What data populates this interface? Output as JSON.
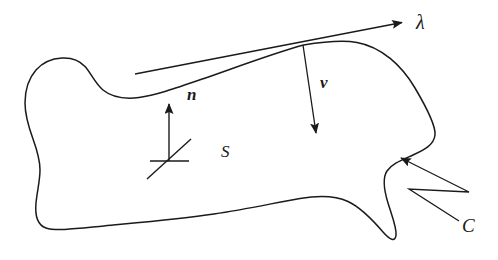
{
  "figure": {
    "background_color": "#ffffff",
    "stroke_color": "#1a1a1a",
    "width": 498,
    "height": 260
  },
  "labels": {
    "lambda": {
      "text": "λ",
      "name": "tangent-vector-label",
      "description": "tangent direction along boundary curve"
    },
    "nu": {
      "text": "ν",
      "name": "conormal-vector-label",
      "description": "outward conormal vector on the surface"
    },
    "n": {
      "text": "n",
      "name": "normal-vector-label",
      "description": "unit normal to the surface"
    },
    "surface": {
      "text": "S",
      "name": "surface-label",
      "description": "the oriented surface region"
    },
    "curve": {
      "text": "C",
      "name": "boundary-curve-label",
      "description": "the boundary curve of the surface"
    }
  },
  "elements": {
    "surface_outline": {
      "name": "surface-boundary-curve",
      "stroke": "#1a1a1a",
      "stroke_width": 1.4,
      "fill": "none"
    },
    "lambda_arrow": {
      "name": "lambda-tangent-arrow",
      "from": [
        135,
        74
      ],
      "to": [
        404,
        22
      ],
      "stroke": "#1a1a1a"
    },
    "nu_arrow": {
      "name": "nu-conormal-arrow",
      "from": [
        303,
        45
      ],
      "to": [
        316,
        137
      ],
      "stroke": "#1a1a1a"
    },
    "n_arrow": {
      "name": "n-normal-arrow",
      "from": [
        169,
        161
      ],
      "to": [
        169,
        100
      ],
      "stroke": "#1a1a1a"
    },
    "tangent_plane_marks": {
      "name": "tangent-plane-cross-mark",
      "horizontal": [
        [
          150,
          161
        ],
        [
          188,
          161
        ]
      ],
      "diagonal": [
        [
          148,
          178
        ],
        [
          190,
          139
        ]
      ],
      "stroke": "#1a1a1a"
    },
    "c_leader": {
      "name": "c-leader-zigzag-arrow",
      "points": [
        [
          459,
          222
        ],
        [
          408,
          190
        ],
        [
          468,
          192
        ],
        [
          400,
          156
        ]
      ],
      "stroke": "#1a1a1a"
    }
  }
}
